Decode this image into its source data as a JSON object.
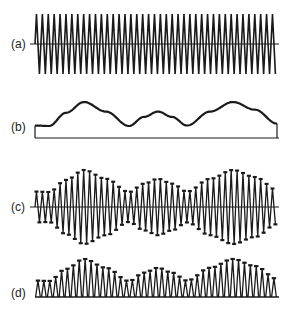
{
  "figure": {
    "stroke_color": "#1a1a1a",
    "background": "#ffffff",
    "x_start": 35,
    "x_end": 277,
    "carrier_period_px": 5.9,
    "panels": [
      {
        "id": "a",
        "label": "(a)",
        "label_y": 38,
        "type": "carrier",
        "center_y": 44,
        "amplitude": 30
      },
      {
        "id": "b",
        "label": "(b)",
        "label_y": 121,
        "type": "modulating",
        "baseline_y": 138
      },
      {
        "id": "c",
        "label": "(c)",
        "label_y": 201,
        "type": "am",
        "center_y": 207,
        "min_amp": 15,
        "max_amp": 37
      },
      {
        "id": "d",
        "label": "(d)",
        "label_y": 287,
        "type": "rectified",
        "baseline_y": 297,
        "min_amp": 16,
        "max_amp": 38
      }
    ],
    "envelope_points": [
      [
        35,
        0.02
      ],
      [
        49,
        0.0
      ],
      [
        66,
        0.55
      ],
      [
        84,
        1.0
      ],
      [
        106,
        0.6
      ],
      [
        129,
        0.0
      ],
      [
        144,
        0.38
      ],
      [
        158,
        0.6
      ],
      [
        172,
        0.38
      ],
      [
        187,
        0.02
      ],
      [
        210,
        0.6
      ],
      [
        233,
        1.0
      ],
      [
        255,
        0.68
      ],
      [
        277,
        0.1
      ]
    ],
    "modulating_y_range": [
      102,
      126
    ]
  }
}
